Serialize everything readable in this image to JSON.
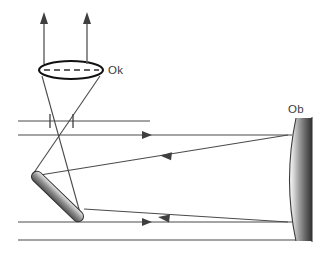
{
  "figure": {
    "background_color": "#ffffff",
    "width": 330,
    "height": 270
  },
  "labels": {
    "eyepiece": "Ok",
    "objective": "Ob"
  },
  "colors": {
    "ray_stroke": "#4a4a4a",
    "lens_outline": "#111111",
    "mirror_light": "#f2f2f2",
    "mirror_mid": "#9a9a9a",
    "mirror_dark": "#3a3a3a",
    "objective_dark": "#2e2e2e",
    "label_text": "#3b3b3b"
  },
  "components": {
    "eyepiece_lens": {
      "name": "Ok",
      "shape": "ellipse",
      "center_x": 71,
      "center_y": 70,
      "radius_x": 32,
      "radius_y": 9,
      "has_dashed_axis": true
    },
    "objective_mirror": {
      "name": "Ob",
      "shape": "concave-mirror",
      "x_left_vertex": 286,
      "x_right_edge": 312,
      "y_top": 118,
      "y_bottom": 241
    },
    "diagonal_mirror": {
      "name": "flat diagonal mirror",
      "shape": "tilted-capsule",
      "x1": 33,
      "y1": 173,
      "x2": 82,
      "y2": 220,
      "thickness": 11,
      "angle_degrees": 45
    },
    "focal_point": {
      "x": 72,
      "y": 131
    }
  },
  "rays": {
    "incoming": [
      {
        "id": "incoming-upper",
        "y": 135,
        "x_start": 18,
        "x_end": 300,
        "arrow": "right",
        "arrow_x": 160
      },
      {
        "id": "incoming-upper-edge",
        "y": 121,
        "x_start": 18,
        "x_end": 150,
        "arrow": "none"
      },
      {
        "id": "incoming-lower",
        "y": 222,
        "x_start": 18,
        "x_end": 300,
        "arrow": "right",
        "arrow_x": 160
      },
      {
        "id": "incoming-lower-edge",
        "y": 240,
        "x_start": 18,
        "x_end": 300,
        "arrow": "none"
      }
    ],
    "reflected": [
      {
        "id": "reflected-upper",
        "x_start": 288,
        "y_start": 135,
        "x_end": 40,
        "y_end": 175,
        "arrow": "left",
        "arrow_t": 0.52
      },
      {
        "id": "reflected-lower",
        "x_start": 288,
        "y_start": 222,
        "x_end": 84,
        "y_end": 209,
        "arrow": "left",
        "arrow_t": 0.52
      }
    ],
    "exit": [
      {
        "id": "exit-ray-left",
        "x": 44,
        "y_start": 62,
        "y_end": 18,
        "arrow": "up"
      },
      {
        "id": "exit-ray-right",
        "x": 87,
        "y_start": 62,
        "y_end": 18,
        "arrow": "up"
      }
    ],
    "cone": [
      {
        "id": "cone-left-edge",
        "x_start": 42,
        "y_start": 75,
        "x_end": 82,
        "y_end": 220
      },
      {
        "id": "cone-right-edge",
        "x_start": 100,
        "y_start": 75,
        "x_end": 33,
        "y_end": 173
      }
    ],
    "field_stop_ticks": [
      {
        "id": "tick-left",
        "x": 50,
        "y_top": 114,
        "y_bottom": 128
      },
      {
        "id": "tick-right",
        "x": 73,
        "y_top": 114,
        "y_bottom": 128
      }
    ]
  }
}
